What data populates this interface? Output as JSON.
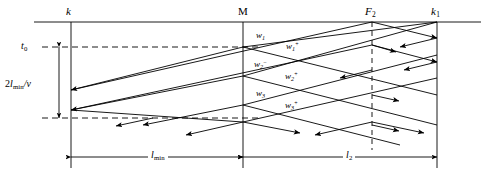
{
  "figure": {
    "kind": "space-time-ray-diagram",
    "width": 489,
    "height": 177,
    "line_color": "#000000",
    "background": "#ffffff",
    "dash_color": "#000000"
  },
  "top_labels": [
    {
      "id": "k",
      "text": "k",
      "style": "italic",
      "x": 68,
      "y": 13
    },
    {
      "id": "M",
      "text": "M",
      "style": "upright",
      "x": 239,
      "y": 13
    },
    {
      "id": "F2",
      "base": "F",
      "sub": "2",
      "style": "italic",
      "x": 366,
      "y": 13
    },
    {
      "id": "k1",
      "base": "k",
      "sub": "1",
      "style": "italic",
      "x": 432,
      "y": 13
    }
  ],
  "left_labels": [
    {
      "id": "t0",
      "base": "t",
      "sub": "0",
      "style": "italic",
      "x": 22,
      "y": 42
    },
    {
      "id": "round-trip-time",
      "text_prefix": "2",
      "text_l": "l",
      "text_sub": "min",
      "text_suffix": "/v",
      "x": 6,
      "y": 80
    }
  ],
  "ray_labels": [
    {
      "id": "w1",
      "base": "w",
      "sub": "1",
      "sup": "",
      "x": 256,
      "y": 33
    },
    {
      "id": "w1-plus",
      "base": "w",
      "sub": "1",
      "sup": "+",
      "x": 286,
      "y": 44
    },
    {
      "id": "w2-minus",
      "base": "w",
      "sub": "2",
      "sup": "−",
      "x": 254,
      "y": 62
    },
    {
      "id": "w2-plus",
      "base": "w",
      "sub": "2",
      "sup": "+",
      "x": 285,
      "y": 74
    },
    {
      "id": "w3",
      "base": "w",
      "sub": "3",
      "sup": "",
      "x": 256,
      "y": 91
    },
    {
      "id": "w3-plus",
      "base": "w",
      "sub": "3",
      "sup": "+",
      "x": 285,
      "y": 103
    }
  ],
  "dimension_labels": [
    {
      "id": "l-min",
      "base": "l",
      "sub": "min",
      "x": 150,
      "y": 149
    },
    {
      "id": "l2",
      "base": "l",
      "sub": "2",
      "x": 344,
      "y": 149
    }
  ],
  "geometry": {
    "x_k": 71,
    "x_M": 243,
    "x_F2": 372,
    "x_k1": 437,
    "y_top_axis": 22,
    "y_bottom": 145,
    "y_dim_row": 157,
    "y_t0": 47,
    "y_2lv_bottom": 118,
    "vertical_line_top": 22,
    "vertical_line_bottom": 168
  }
}
